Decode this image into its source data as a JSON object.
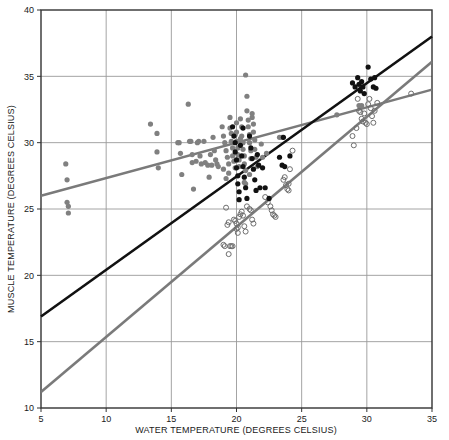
{
  "chart_data": {
    "type": "scatter",
    "title": "",
    "xlabel": "WATER TEMPERATURE (DEGREES CELSIUS)",
    "ylabel": "MUSCLE TEMPERATURE (DEGREES CELSIUS)",
    "xlim": [
      5,
      35
    ],
    "ylim": [
      10,
      40
    ],
    "xticks": [
      5,
      10,
      15,
      20,
      25,
      30,
      35
    ],
    "yticks": [
      10,
      15,
      20,
      25,
      30,
      35,
      40
    ],
    "grid": true,
    "legend": "none",
    "colors": {
      "gray_filled": "#808080",
      "black_filled": "#111111",
      "open_circle": "#6e6e6e",
      "gray_line": "#7a7a7a",
      "black_line": "#111111",
      "grid_line": "#9a9a9a",
      "frame": "#333333"
    },
    "series": [
      {
        "name": "gray-filled-points",
        "marker": "filled-circle",
        "color": "#808080",
        "points": [
          [
            6.9,
            28.4
          ],
          [
            7.0,
            27.2
          ],
          [
            7.0,
            25.5
          ],
          [
            7.1,
            25.2
          ],
          [
            7.1,
            24.7
          ],
          [
            13.4,
            31.4
          ],
          [
            13.9,
            30.7
          ],
          [
            13.9,
            29.3
          ],
          [
            14.0,
            28.1
          ],
          [
            15.5,
            30.0
          ],
          [
            15.6,
            30.0
          ],
          [
            15.7,
            29.2
          ],
          [
            15.8,
            27.6
          ],
          [
            16.3,
            32.9
          ],
          [
            16.4,
            30.1
          ],
          [
            16.5,
            30.1
          ],
          [
            16.6,
            29.1
          ],
          [
            16.6,
            28.5
          ],
          [
            16.7,
            26.5
          ],
          [
            17.0,
            30.0
          ],
          [
            17.1,
            30.1
          ],
          [
            17.2,
            29.0
          ],
          [
            17.3,
            28.4
          ],
          [
            17.5,
            30.1
          ],
          [
            17.6,
            28.5
          ],
          [
            17.8,
            28.3
          ],
          [
            17.9,
            27.4
          ],
          [
            18.2,
            30.4
          ],
          [
            18.3,
            29.4
          ],
          [
            18.4,
            28.7
          ],
          [
            18.5,
            28.4
          ],
          [
            18.6,
            28.2
          ],
          [
            18.9,
            31.2
          ],
          [
            19.0,
            30.5
          ],
          [
            19.1,
            30.0
          ],
          [
            19.2,
            29.4
          ],
          [
            19.3,
            28.9
          ],
          [
            19.4,
            28.4
          ],
          [
            19.4,
            27.7
          ],
          [
            19.5,
            31.9
          ],
          [
            19.5,
            31.1
          ],
          [
            19.6,
            30.7
          ],
          [
            19.6,
            30.1
          ],
          [
            19.7,
            29.6
          ],
          [
            19.7,
            29.0
          ],
          [
            19.8,
            28.6
          ],
          [
            19.9,
            28.1
          ],
          [
            19.9,
            30.6
          ],
          [
            20.0,
            31.5
          ],
          [
            20.0,
            30.8
          ],
          [
            20.0,
            30.1
          ],
          [
            20.1,
            29.6
          ],
          [
            20.1,
            29.1
          ],
          [
            20.2,
            28.7
          ],
          [
            20.2,
            28.2
          ],
          [
            20.3,
            30.3
          ],
          [
            20.3,
            31.8
          ],
          [
            20.4,
            31.2
          ],
          [
            20.4,
            30.5
          ],
          [
            20.5,
            30.0
          ],
          [
            20.5,
            29.5
          ],
          [
            20.6,
            29.0
          ],
          [
            20.6,
            28.4
          ],
          [
            20.7,
            27.9
          ],
          [
            20.7,
            26.9
          ],
          [
            20.8,
            33.5
          ],
          [
            20.8,
            32.4
          ],
          [
            20.9,
            31.7
          ],
          [
            20.9,
            31.2
          ],
          [
            21.0,
            30.6
          ],
          [
            21.0,
            30.0
          ],
          [
            21.1,
            29.4
          ],
          [
            21.1,
            28.8
          ],
          [
            21.2,
            32.2
          ],
          [
            21.2,
            31.9
          ],
          [
            21.3,
            31.4
          ],
          [
            21.3,
            30.8
          ],
          [
            21.4,
            30.2
          ],
          [
            21.4,
            29.5
          ],
          [
            21.5,
            28.9
          ],
          [
            21.6,
            28.2
          ],
          [
            20.7,
            35.1
          ],
          [
            18.0,
            29.1
          ],
          [
            18.1,
            28.3
          ],
          [
            16.9,
            28.6
          ],
          [
            19.0,
            28.0
          ],
          [
            19.2,
            27.3
          ],
          [
            20.6,
            27.0
          ],
          [
            21.0,
            27.6
          ],
          [
            21.9,
            29.9
          ],
          [
            22.0,
            28.9
          ],
          [
            22.3,
            29.2
          ],
          [
            23.3,
            30.4
          ],
          [
            23.5,
            30.4
          ],
          [
            27.7,
            32.1
          ],
          [
            29.4,
            32.8
          ],
          [
            29.6,
            32.8
          ]
        ]
      },
      {
        "name": "black-filled-points",
        "marker": "filled-circle",
        "color": "#111111",
        "points": [
          [
            19.7,
            31.2
          ],
          [
            19.8,
            30.5
          ],
          [
            19.9,
            30.0
          ],
          [
            19.9,
            29.3
          ],
          [
            20.0,
            28.7
          ],
          [
            20.0,
            28.1
          ],
          [
            20.1,
            27.5
          ],
          [
            20.1,
            26.9
          ],
          [
            20.2,
            26.3
          ],
          [
            20.2,
            25.7
          ],
          [
            20.3,
            29.8
          ],
          [
            20.4,
            29.0
          ],
          [
            20.5,
            28.2
          ],
          [
            20.6,
            27.4
          ],
          [
            20.7,
            26.6
          ],
          [
            20.8,
            25.8
          ],
          [
            21.0,
            30.5
          ],
          [
            21.1,
            29.6
          ],
          [
            21.2,
            28.8
          ],
          [
            21.3,
            28.0
          ],
          [
            21.4,
            27.2
          ],
          [
            21.5,
            26.4
          ],
          [
            21.6,
            29.1
          ],
          [
            21.7,
            28.3
          ],
          [
            22.0,
            28.1
          ],
          [
            22.2,
            26.6
          ],
          [
            22.5,
            25.8
          ],
          [
            23.3,
            28.9
          ],
          [
            23.5,
            28.3
          ],
          [
            23.6,
            30.4
          ],
          [
            23.7,
            28.2
          ],
          [
            24.1,
            29.0
          ],
          [
            28.9,
            34.5
          ],
          [
            29.1,
            34.2
          ],
          [
            29.3,
            34.9
          ],
          [
            29.4,
            34.4
          ],
          [
            29.5,
            33.9
          ],
          [
            29.6,
            34.6
          ],
          [
            29.7,
            34.2
          ],
          [
            29.8,
            33.7
          ],
          [
            30.1,
            35.7
          ],
          [
            30.3,
            34.8
          ],
          [
            30.5,
            34.2
          ],
          [
            30.6,
            34.9
          ],
          [
            30.7,
            34.1
          ],
          [
            20.5,
            31.1
          ],
          [
            21.8,
            26.6
          ]
        ]
      },
      {
        "name": "open-circle-points",
        "marker": "open-circle",
        "color": "#6e6e6e",
        "points": [
          [
            19.2,
            25.1
          ],
          [
            19.4,
            21.6
          ],
          [
            19.5,
            22.2
          ],
          [
            19.6,
            22.2
          ],
          [
            19.7,
            22.2
          ],
          [
            19.8,
            24.2
          ],
          [
            19.9,
            24.1
          ],
          [
            20.0,
            23.9
          ],
          [
            20.0,
            23.5
          ],
          [
            20.1,
            23.2
          ],
          [
            20.1,
            23.6
          ],
          [
            20.2,
            24.4
          ],
          [
            20.3,
            24.6
          ],
          [
            20.4,
            24.8
          ],
          [
            20.5,
            24.5
          ],
          [
            20.6,
            23.7
          ],
          [
            20.7,
            23.3
          ],
          [
            19.0,
            22.3
          ],
          [
            19.1,
            22.2
          ],
          [
            19.3,
            23.8
          ],
          [
            19.4,
            24.0
          ],
          [
            20.8,
            25.2
          ],
          [
            21.0,
            25.0
          ],
          [
            21.1,
            24.9
          ],
          [
            21.2,
            24.2
          ],
          [
            21.3,
            23.9
          ],
          [
            22.2,
            25.9
          ],
          [
            22.4,
            25.5
          ],
          [
            22.6,
            25.2
          ],
          [
            22.7,
            24.9
          ],
          [
            22.8,
            24.6
          ],
          [
            22.9,
            24.5
          ],
          [
            23.0,
            24.4
          ],
          [
            23.6,
            27.2
          ],
          [
            23.8,
            26.8
          ],
          [
            23.9,
            26.5
          ],
          [
            24.0,
            26.4
          ],
          [
            23.7,
            27.4
          ],
          [
            24.1,
            28.0
          ],
          [
            24.3,
            29.4
          ],
          [
            28.9,
            30.5
          ],
          [
            29.0,
            29.8
          ],
          [
            29.2,
            31.1
          ],
          [
            29.4,
            32.4
          ],
          [
            29.5,
            32.3
          ],
          [
            29.6,
            31.8
          ],
          [
            29.7,
            31.6
          ],
          [
            29.8,
            32.2
          ],
          [
            29.9,
            31.5
          ],
          [
            30.0,
            31.4
          ],
          [
            30.2,
            33.3
          ],
          [
            30.3,
            32.6
          ],
          [
            30.4,
            32.0
          ],
          [
            30.5,
            31.5
          ],
          [
            30.6,
            32.4
          ],
          [
            30.8,
            33.0
          ],
          [
            33.4,
            33.7
          ],
          [
            29.3,
            33.3
          ],
          [
            30.1,
            32.9
          ],
          [
            24.0,
            26.9
          ]
        ]
      }
    ],
    "lines": [
      {
        "name": "gray-shallow-regression",
        "color": "#7a7a7a",
        "width": 2.4,
        "x_start": 5,
        "y_start": 26.0,
        "x_end": 35,
        "y_end": 34.0
      },
      {
        "name": "black-regression",
        "color": "#111111",
        "width": 2.6,
        "x_start": 5,
        "y_start": 16.9,
        "x_end": 35,
        "y_end": 38.0
      },
      {
        "name": "gray-steep-regression",
        "color": "#7a7a7a",
        "width": 2.6,
        "x_start": 5,
        "y_start": 11.2,
        "x_end": 35,
        "y_end": 36.1
      }
    ]
  }
}
